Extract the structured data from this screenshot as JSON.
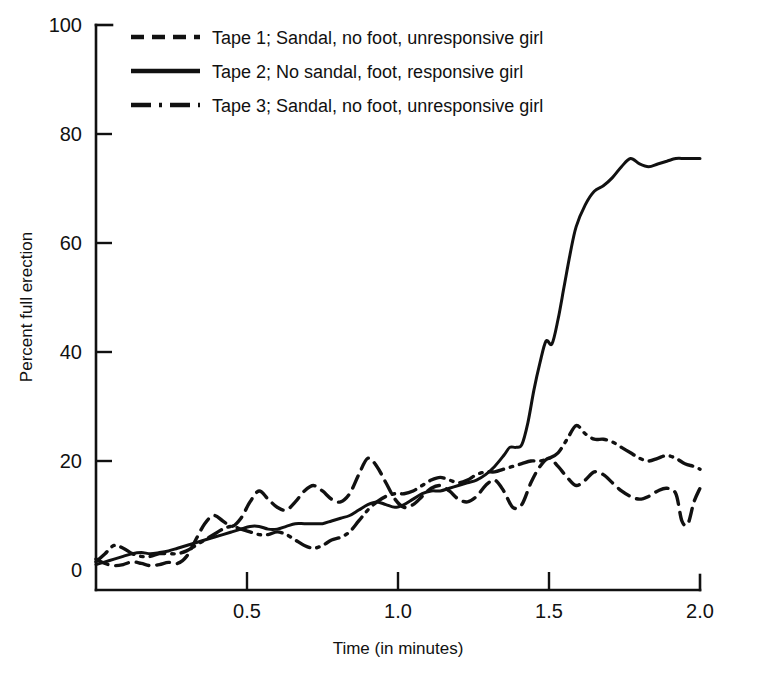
{
  "chart_data": {
    "type": "line",
    "title": "",
    "xlabel": "Time (in minutes)",
    "ylabel": "Percent full erection",
    "xlim": [
      0,
      2.0
    ],
    "ylim": [
      0,
      100
    ],
    "xticks": [
      "0.5",
      "1.0",
      "1.5",
      "2.0"
    ],
    "xtick_values": [
      0.5,
      1.0,
      1.5,
      2.0
    ],
    "yticks": [
      "0",
      "20",
      "40",
      "60",
      "80",
      "100"
    ],
    "ytick_values": [
      0,
      20,
      40,
      60,
      80,
      100
    ],
    "grid": false,
    "legend_position": "top-left-inside",
    "series": [
      {
        "name": "Tape 1; Sandal, no foot, unresponsive girl",
        "style": "dashed",
        "color": "#111111",
        "x": [
          0.0,
          0.03,
          0.06,
          0.09,
          0.12,
          0.15,
          0.18,
          0.21,
          0.24,
          0.27,
          0.3,
          0.33,
          0.36,
          0.39,
          0.42,
          0.45,
          0.48,
          0.51,
          0.54,
          0.57,
          0.6,
          0.63,
          0.66,
          0.69,
          0.72,
          0.75,
          0.78,
          0.81,
          0.84,
          0.87,
          0.9,
          0.93,
          0.96,
          0.99,
          1.02,
          1.05,
          1.08,
          1.11,
          1.14,
          1.17,
          1.2,
          1.23,
          1.26,
          1.29,
          1.32,
          1.35,
          1.38,
          1.41,
          1.44,
          1.47,
          1.5,
          1.53,
          1.56,
          1.59,
          1.62,
          1.65,
          1.68,
          1.71,
          1.74,
          1.77,
          1.8,
          1.83,
          1.86,
          1.89,
          1.92,
          1.94,
          1.96,
          1.98,
          2.0
        ],
        "y": [
          2.0,
          1.2,
          0.8,
          1.0,
          1.5,
          1.2,
          0.8,
          1.0,
          1.4,
          1.2,
          2.5,
          5.5,
          8.5,
          10.0,
          9.0,
          8.0,
          9.5,
          12.5,
          14.5,
          13.0,
          11.5,
          11.0,
          12.5,
          14.5,
          15.5,
          14.5,
          13.0,
          12.5,
          14.0,
          17.5,
          20.5,
          19.0,
          16.0,
          13.0,
          11.5,
          12.0,
          13.5,
          15.0,
          15.5,
          14.5,
          13.0,
          12.5,
          13.5,
          15.5,
          16.5,
          14.5,
          11.5,
          12.0,
          16.0,
          19.0,
          20.5,
          19.0,
          17.0,
          15.5,
          16.5,
          18.0,
          17.5,
          16.0,
          14.5,
          13.5,
          13.0,
          13.5,
          14.5,
          15.0,
          14.0,
          9.0,
          8.5,
          12.5,
          15.0
        ]
      },
      {
        "name": "Tape 2; No sandal, foot, responsive girl",
        "style": "solid",
        "color": "#111111",
        "x": [
          0.0,
          0.03,
          0.06,
          0.09,
          0.12,
          0.15,
          0.18,
          0.21,
          0.24,
          0.27,
          0.3,
          0.33,
          0.36,
          0.39,
          0.42,
          0.45,
          0.48,
          0.51,
          0.54,
          0.57,
          0.6,
          0.63,
          0.66,
          0.69,
          0.72,
          0.75,
          0.78,
          0.81,
          0.84,
          0.87,
          0.9,
          0.93,
          0.96,
          0.99,
          1.02,
          1.05,
          1.08,
          1.11,
          1.14,
          1.17,
          1.2,
          1.23,
          1.26,
          1.29,
          1.32,
          1.35,
          1.37,
          1.39,
          1.41,
          1.43,
          1.45,
          1.47,
          1.49,
          1.51,
          1.53,
          1.55,
          1.57,
          1.59,
          1.62,
          1.65,
          1.68,
          1.71,
          1.74,
          1.77,
          1.8,
          1.83,
          1.86,
          1.89,
          1.92,
          1.95,
          1.98,
          2.0
        ],
        "y": [
          1.0,
          1.5,
          2.0,
          2.5,
          3.0,
          3.2,
          3.0,
          3.2,
          3.5,
          4.0,
          4.5,
          5.0,
          5.5,
          6.0,
          6.5,
          7.0,
          7.5,
          8.0,
          8.0,
          7.5,
          7.5,
          8.0,
          8.5,
          8.5,
          8.5,
          8.5,
          9.0,
          9.5,
          10.0,
          11.0,
          12.0,
          12.5,
          12.0,
          11.5,
          12.0,
          13.0,
          14.0,
          14.5,
          14.5,
          15.0,
          15.5,
          16.0,
          16.5,
          17.5,
          19.0,
          21.0,
          22.5,
          22.5,
          23.0,
          27.0,
          33.0,
          38.0,
          42.0,
          41.5,
          46.0,
          52.0,
          58.0,
          63.0,
          67.0,
          69.5,
          70.5,
          72.0,
          74.0,
          75.5,
          74.5,
          74.0,
          74.5,
          75.0,
          75.5,
          75.5,
          75.5,
          75.5
        ]
      },
      {
        "name": "Tape 3; Sandal, no foot, unresponsive girl",
        "style": "dash-dot",
        "color": "#111111",
        "x": [
          0.0,
          0.03,
          0.06,
          0.09,
          0.12,
          0.15,
          0.18,
          0.21,
          0.24,
          0.27,
          0.3,
          0.33,
          0.36,
          0.39,
          0.42,
          0.45,
          0.48,
          0.51,
          0.54,
          0.57,
          0.6,
          0.63,
          0.66,
          0.69,
          0.72,
          0.75,
          0.78,
          0.81,
          0.84,
          0.87,
          0.9,
          0.93,
          0.96,
          0.99,
          1.02,
          1.05,
          1.08,
          1.11,
          1.14,
          1.17,
          1.2,
          1.23,
          1.26,
          1.29,
          1.32,
          1.35,
          1.38,
          1.41,
          1.44,
          1.47,
          1.5,
          1.53,
          1.56,
          1.59,
          1.62,
          1.65,
          1.68,
          1.71,
          1.74,
          1.77,
          1.8,
          1.83,
          1.86,
          1.89,
          1.92,
          1.95,
          1.98,
          2.0
        ],
        "y": [
          1.5,
          3.0,
          4.5,
          4.0,
          3.0,
          2.5,
          2.5,
          3.0,
          3.0,
          3.0,
          3.5,
          4.5,
          5.5,
          6.5,
          7.5,
          8.0,
          7.5,
          7.0,
          6.5,
          6.5,
          7.0,
          6.5,
          5.5,
          4.5,
          4.0,
          4.5,
          5.5,
          6.0,
          7.0,
          9.0,
          11.0,
          12.5,
          13.5,
          14.0,
          14.0,
          14.5,
          15.5,
          16.5,
          17.0,
          16.5,
          16.0,
          16.5,
          17.5,
          18.0,
          18.0,
          18.5,
          19.0,
          19.5,
          20.0,
          20.0,
          20.5,
          21.5,
          24.0,
          26.5,
          25.0,
          24.0,
          24.0,
          23.5,
          22.5,
          21.5,
          20.5,
          20.0,
          20.5,
          21.0,
          20.5,
          19.5,
          19.0,
          18.5
        ]
      }
    ]
  },
  "legend": {
    "entries": [
      {
        "label": "Tape 1; Sandal, no foot, unresponsive girl",
        "style": "dashed"
      },
      {
        "label": "Tape 2; No sandal, foot, responsive girl",
        "style": "solid"
      },
      {
        "label": "Tape 3; Sandal, no foot, unresponsive girl",
        "style": "dash-dot"
      }
    ]
  }
}
